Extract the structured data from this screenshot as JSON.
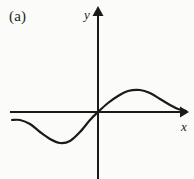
{
  "figure": {
    "panel_label": "(a)",
    "background_color": "#fbfbfa",
    "ink_color": "#1a1a1a",
    "width": 194,
    "height": 179
  },
  "axes": {
    "x_label": "x",
    "y_label": "y",
    "x_axis_color": "#1a1a1a",
    "y_axis_color": "#1a1a1a",
    "origin_px": [
      98,
      112
    ],
    "x_axis_extent_px": [
      10,
      186
    ],
    "y_axis_extent_px": [
      8,
      179
    ],
    "x_arrow": "arrow-right",
    "y_arrow": "arrow-up",
    "ticks": [],
    "tick_labels": [],
    "gridlines": false
  },
  "chart_data": {
    "type": "line",
    "title": "(a)",
    "xlabel": "x",
    "ylabel": "y",
    "grid": false,
    "legend": null,
    "axis_arrows": true,
    "tick_labels": [],
    "series": [
      {
        "name": "curve",
        "color": "#1a1a1a",
        "stroke_width": 2.2,
        "points_px": [
          [
            12,
            120
          ],
          [
            20,
            120
          ],
          [
            30,
            124
          ],
          [
            40,
            132
          ],
          [
            50,
            139
          ],
          [
            60,
            143
          ],
          [
            70,
            141
          ],
          [
            80,
            132
          ],
          [
            90,
            120
          ],
          [
            98,
            112
          ],
          [
            108,
            103
          ],
          [
            118,
            96
          ],
          [
            128,
            91
          ],
          [
            140,
            90
          ],
          [
            150,
            93
          ],
          [
            160,
            99
          ],
          [
            170,
            105
          ],
          [
            178,
            109
          ],
          [
            186,
            111
          ]
        ],
        "key_features": [
          {
            "name": "left-endpoint",
            "x_px": 12,
            "y_px": 120
          },
          {
            "name": "local-minimum",
            "x_px": 60,
            "y_px": 143
          },
          {
            "name": "origin-crossing",
            "x_px": 98,
            "y_px": 112
          },
          {
            "name": "local-maximum",
            "x_px": 140,
            "y_px": 90
          },
          {
            "name": "right-endpoint",
            "x_px": 186,
            "y_px": 111
          }
        ]
      }
    ]
  }
}
